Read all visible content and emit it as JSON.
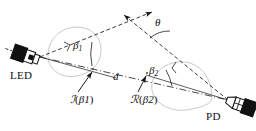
{
  "figure": {
    "type": "optical-link-geometry-diagram",
    "background_color": "#ffffff",
    "line_color": "#1a1a1a",
    "lobe_color": "#c8c8c8"
  },
  "devices": {
    "led": {
      "label": "LED",
      "label_x": 10,
      "label_y": 71
    },
    "pd": {
      "label": "PD",
      "label_x": 205,
      "label_y": 111
    }
  },
  "angles": {
    "beta1": {
      "symbol": "β",
      "subscript": "1",
      "x": 72,
      "y": 41
    },
    "beta2": {
      "symbol": "β",
      "subscript": "2",
      "x": 148,
      "y": 66
    },
    "theta": {
      "symbol": "θ",
      "x": 154,
      "y": 18
    }
  },
  "distance": {
    "symbol": "d",
    "x": 112,
    "y": 72
  },
  "functions": {
    "irradiance": {
      "script": "ℐ",
      "open": "(",
      "symbol": "β",
      "subscript": "1",
      "close": ")",
      "x": 70,
      "y": 94
    },
    "responsivity": {
      "script": "ℛ",
      "open": "(",
      "symbol": "β",
      "subscript": "2",
      "close": ")",
      "x": 130,
      "y": 94
    }
  }
}
